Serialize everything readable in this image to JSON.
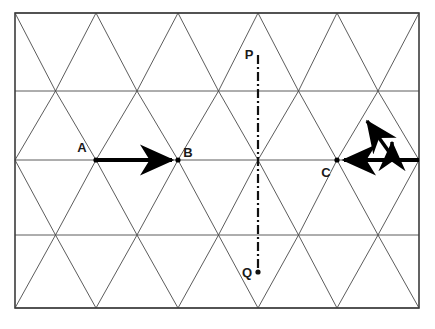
{
  "figure": {
    "kind": "triangular-lattice-diagram",
    "background_color": "#ffffff",
    "border": {
      "color": "#3c3c3c",
      "width_px": 1.6,
      "x0": 15,
      "y0": 13,
      "x1": 419,
      "y1": 308
    },
    "lattice": {
      "line_color": "#4a4a4a",
      "line_width_px": 0.9,
      "column_x": [
        15,
        55.5,
        96,
        137,
        178,
        218.5,
        258,
        298.5,
        337,
        378,
        419
      ],
      "row_y": [
        13,
        91,
        160,
        235,
        308
      ],
      "cell_width_px": 81,
      "cell_height_px": 74,
      "horizontal_rows": 5,
      "description": "Rows of equilateral-style triangles formed by horizontal lines and two families of diagonals"
    },
    "points": [
      {
        "id": "A",
        "label": "A",
        "x": 96,
        "y": 160,
        "label_x": 82,
        "label_y": 152,
        "marker": "vertex-dot"
      },
      {
        "id": "B",
        "label": "B",
        "x": 178,
        "y": 160,
        "label_x": 186,
        "label_y": 157,
        "marker": "vertex-dot"
      },
      {
        "id": "C",
        "label": "C",
        "x": 337,
        "y": 160,
        "label_x": 325,
        "label_y": 176,
        "marker": "vertex-dot"
      },
      {
        "id": "P",
        "label": "P",
        "x": 258,
        "y": 55,
        "label_x": 246,
        "label_y": 55,
        "marker": "none"
      },
      {
        "id": "Q",
        "label": "Q",
        "x": 258,
        "y": 272,
        "label_x": 243,
        "label_y": 274,
        "marker": "dot"
      }
    ],
    "vectors": [
      {
        "id": "AB",
        "from": "A",
        "to": "B",
        "x1": 96,
        "y1": 160,
        "x2": 178,
        "y2": 160,
        "style": "bold-solid",
        "color": "#000000",
        "width_px": 4,
        "arrowhead": "end",
        "orientation": "horizontal-right"
      },
      {
        "id": "C-right",
        "from": "C",
        "to": "border-right",
        "x1": 337,
        "y1": 160,
        "x2": 419,
        "y2": 160,
        "style": "bold-solid",
        "color": "#000000",
        "width_px": 4,
        "arrowhead": "start",
        "orientation": "horizontal-left"
      },
      {
        "id": "diagonal-up-left",
        "x1": 392,
        "y1": 156,
        "x2": 363,
        "y2": 116,
        "style": "bold-solid",
        "color": "#000000",
        "width_px": 3.6,
        "arrowhead": "end",
        "orientation": "diagonal-up-left"
      },
      {
        "id": "short-vertical-up",
        "x1": 392,
        "y1": 161,
        "x2": 392,
        "y2": 138,
        "style": "bold-solid",
        "color": "#000000",
        "width_px": 3.4,
        "arrowhead": "end",
        "orientation": "vertical-up"
      }
    ],
    "dash_dot_line": {
      "id": "PQ",
      "from": "P",
      "to": "Q",
      "x1": 258,
      "y1": 55,
      "x2": 258,
      "y2": 270,
      "color": "#111111",
      "width_px": 2.2,
      "pattern": "dash-dot",
      "dasharray": "9 3 2 3",
      "end_dot": {
        "x": 258,
        "y": 272,
        "r": 2.6
      }
    }
  }
}
